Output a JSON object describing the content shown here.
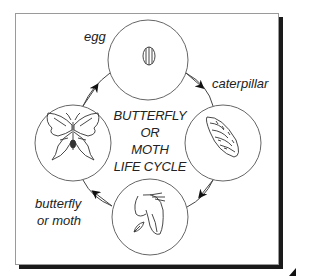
{
  "diagram": {
    "title_lines": [
      "BUTTERFLY OR",
      "MOTH",
      "LIFE CYCLE"
    ],
    "stages": [
      {
        "id": "egg",
        "label": "egg",
        "icon": "egg-icon"
      },
      {
        "id": "caterpillar",
        "label": "caterpillar",
        "icon": "caterpillar-icon"
      },
      {
        "id": "pupa",
        "label": "",
        "icon": "chrysalis-icon"
      },
      {
        "id": "adult",
        "label_lines": [
          "butterfly",
          "or moth"
        ],
        "icon": "butterfly-icon"
      }
    ],
    "flow": [
      "egg",
      "caterpillar",
      "pupa",
      "adult",
      "egg"
    ],
    "colors": {
      "line": "#555555",
      "ink": "#222222",
      "shadow": "#1a1a1a"
    }
  }
}
